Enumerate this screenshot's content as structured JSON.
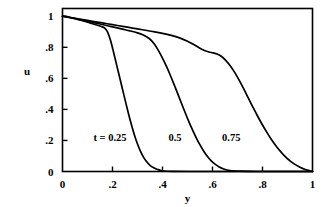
{
  "chart_data": {
    "type": "line",
    "title": "",
    "xlabel": "y",
    "ylabel": "u",
    "xlim": [
      0,
      1
    ],
    "ylim": [
      0,
      1.05
    ],
    "grid": false,
    "legend_position": "inline-annotations",
    "x_ticks": [
      0,
      0.2,
      0.4,
      0.6,
      0.8,
      1
    ],
    "x_tick_labels": [
      "0",
      ".2",
      ".4",
      ".6",
      ".8",
      "1"
    ],
    "y_ticks": [
      0,
      0.2,
      0.4,
      0.6,
      0.8,
      1
    ],
    "y_tick_labels": [
      "0",
      ".2",
      ".4",
      ".6",
      ".8",
      "1"
    ],
    "annotations": [
      {
        "text": "t = 0.25",
        "x": 0.19,
        "y": 0.225
      },
      {
        "text": "0.5",
        "x": 0.45,
        "y": 0.225
      },
      {
        "text": "0.75",
        "x": 0.675,
        "y": 0.225
      }
    ],
    "series": [
      {
        "name": "t = 0.25",
        "label": "t = 0.25",
        "color": "#000000",
        "x": [
          0.0,
          0.02,
          0.04,
          0.06,
          0.08,
          0.1,
          0.12,
          0.14,
          0.155,
          0.168,
          0.18,
          0.192,
          0.204,
          0.216,
          0.228,
          0.24,
          0.252,
          0.264,
          0.276,
          0.288,
          0.3,
          0.312,
          0.324,
          0.336,
          0.35,
          0.365,
          0.38,
          0.4,
          0.44,
          0.52,
          0.64,
          0.8,
          1.0
        ],
        "y": [
          1.0,
          0.995,
          0.988,
          0.98,
          0.971,
          0.962,
          0.952,
          0.942,
          0.934,
          0.925,
          0.9,
          0.845,
          0.77,
          0.69,
          0.61,
          0.53,
          0.45,
          0.372,
          0.3,
          0.234,
          0.177,
          0.13,
          0.093,
          0.064,
          0.04,
          0.024,
          0.013,
          0.005,
          0.001,
          0.0,
          0.0,
          0.0,
          0.0
        ]
      },
      {
        "name": "t = 0.5",
        "label": "0.5",
        "color": "#000000",
        "x": [
          0.0,
          0.03,
          0.06,
          0.09,
          0.12,
          0.15,
          0.18,
          0.21,
          0.24,
          0.27,
          0.3,
          0.325,
          0.348,
          0.368,
          0.385,
          0.4,
          0.415,
          0.43,
          0.445,
          0.46,
          0.475,
          0.49,
          0.505,
          0.52,
          0.535,
          0.55,
          0.565,
          0.58,
          0.595,
          0.61,
          0.625,
          0.645,
          0.67,
          0.71,
          0.78,
          0.88,
          1.0
        ],
        "y": [
          1.0,
          0.992,
          0.982,
          0.972,
          0.961,
          0.95,
          0.939,
          0.928,
          0.917,
          0.906,
          0.893,
          0.878,
          0.855,
          0.82,
          0.775,
          0.73,
          0.68,
          0.625,
          0.566,
          0.505,
          0.443,
          0.382,
          0.323,
          0.268,
          0.217,
          0.171,
          0.131,
          0.097,
          0.069,
          0.047,
          0.031,
          0.016,
          0.006,
          0.002,
          0.0,
          0.0,
          0.0
        ]
      },
      {
        "name": "t = 0.75",
        "label": "0.75",
        "color": "#000000",
        "x": [
          0.0,
          0.04,
          0.08,
          0.12,
          0.16,
          0.2,
          0.24,
          0.28,
          0.32,
          0.36,
          0.4,
          0.435,
          0.468,
          0.498,
          0.525,
          0.548,
          0.568,
          0.586,
          0.602,
          0.618,
          0.635,
          0.652,
          0.67,
          0.688,
          0.706,
          0.724,
          0.742,
          0.76,
          0.778,
          0.796,
          0.815,
          0.835,
          0.858,
          0.885,
          0.915,
          0.95,
          0.975,
          1.0
        ],
        "y": [
          1.0,
          0.99,
          0.979,
          0.968,
          0.957,
          0.946,
          0.935,
          0.924,
          0.913,
          0.902,
          0.89,
          0.877,
          0.861,
          0.841,
          0.818,
          0.796,
          0.78,
          0.77,
          0.764,
          0.757,
          0.742,
          0.718,
          0.683,
          0.64,
          0.59,
          0.535,
          0.477,
          0.42,
          0.364,
          0.311,
          0.259,
          0.208,
          0.156,
          0.106,
          0.062,
          0.027,
          0.011,
          0.0
        ]
      }
    ]
  }
}
